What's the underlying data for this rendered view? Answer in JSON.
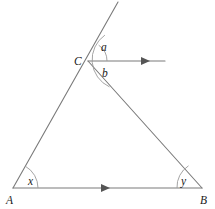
{
  "figure": {
    "kind": "geometry-diagram",
    "background_color": "#ffffff",
    "line_color": "#7a7a7a",
    "arc_color": "#9a9a9a",
    "arrow_color": "#555555",
    "label_color": "#1a1a1a"
  },
  "vertices": [
    {
      "name": "A",
      "label": "A",
      "x": 13,
      "y": 188,
      "label_x": 6,
      "label_y": 204
    },
    {
      "name": "B",
      "label": "B",
      "x": 202,
      "y": 188,
      "label_x": 200,
      "label_y": 204
    },
    {
      "name": "C",
      "label": "C",
      "x": 88,
      "y": 61,
      "label_x": 74,
      "label_y": 65
    }
  ],
  "segments": [
    {
      "name": "side-ab",
      "from": "A",
      "to": "B",
      "x1": 13,
      "y1": 188,
      "x2": 202,
      "y2": 188
    },
    {
      "name": "side-ac-extended",
      "from": "A",
      "to": "extension",
      "x1": 13,
      "y1": 188,
      "x2": 118,
      "y2": 2
    },
    {
      "name": "side-cb",
      "from": "C",
      "to": "B",
      "x1": 88,
      "y1": 61,
      "x2": 202,
      "y2": 188
    },
    {
      "name": "ray-from-c",
      "from": "C",
      "to": "ray-end",
      "x1": 88,
      "y1": 61,
      "x2": 165,
      "y2": 61
    }
  ],
  "arrowheads": [
    {
      "name": "arrow-on-ab",
      "x": 107,
      "y": 188,
      "direction": "right"
    },
    {
      "name": "arrow-on-ray",
      "x": 147,
      "y": 61,
      "direction": "right"
    }
  ],
  "angles": [
    {
      "name": "angle-a",
      "label": "a",
      "vertex": "C",
      "label_x": 104,
      "label_y": 51,
      "arc_radius": 19
    },
    {
      "name": "angle-b",
      "label": "b",
      "vertex": "C",
      "label_x": 105,
      "label_y": 74,
      "arc_radius": 30
    },
    {
      "name": "angle-x",
      "label": "x",
      "vertex": "A",
      "label_x": 30,
      "label_y": 184,
      "arc_radius": 25
    },
    {
      "name": "angle-y",
      "label": "y",
      "vertex": "B",
      "label_x": 182,
      "label_y": 184,
      "arc_radius": 25
    }
  ],
  "arc_paths": {
    "angle_a": "M 103.8 44.5 A 19 19 0 0 1 107 61",
    "angle_b": "M 112.6 34.5 A 30 30 0 0 0 112.6 87.5",
    "angle_x": "M 38 188 A 25 25 0 0 0 26.9 167.1",
    "angle_y": "M 177 188 A 25 25 0 0 1 188.9 166.9"
  }
}
